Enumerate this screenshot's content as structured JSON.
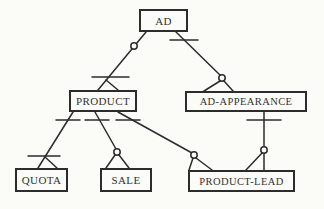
{
  "diagram": {
    "type": "entity-relationship-crow-foot",
    "entities": [
      {
        "id": "ad",
        "label": "AD"
      },
      {
        "id": "product",
        "label": "PRODUCT"
      },
      {
        "id": "ad-appearance",
        "label": "AD-APPEARANCE"
      },
      {
        "id": "quota",
        "label": "QUOTA"
      },
      {
        "id": "sale",
        "label": "SALE"
      },
      {
        "id": "product-lead",
        "label": "PRODUCT-LEAD"
      }
    ],
    "relationships": [
      {
        "from": "AD",
        "to": "PRODUCT",
        "marker_near_from": "circle",
        "marker_near_to": "bar + crow-foot"
      },
      {
        "from": "AD",
        "to": "AD-APPEARANCE",
        "marker_near_from": "bar",
        "marker_near_to": "circle + crow-foot"
      },
      {
        "from": "PRODUCT",
        "to": "QUOTA",
        "marker_near_from": "bar",
        "marker_near_to": "bar + crow-foot"
      },
      {
        "from": "PRODUCT",
        "to": "SALE",
        "marker_near_from": "bar",
        "marker_near_to": "circle + crow-foot"
      },
      {
        "from": "PRODUCT",
        "to": "PRODUCT-LEAD",
        "marker_near_from": "bar",
        "marker_near_to": "circle + crow-foot"
      },
      {
        "from": "AD-APPEARANCE",
        "to": "PRODUCT-LEAD",
        "marker_near_from": "bar",
        "marker_near_to": "circle + crow-foot"
      }
    ],
    "colors": {
      "line": "#2c2c2c",
      "box_border": "#2c2c2c",
      "background": "#fbfbf8",
      "text": "#333333"
    }
  }
}
